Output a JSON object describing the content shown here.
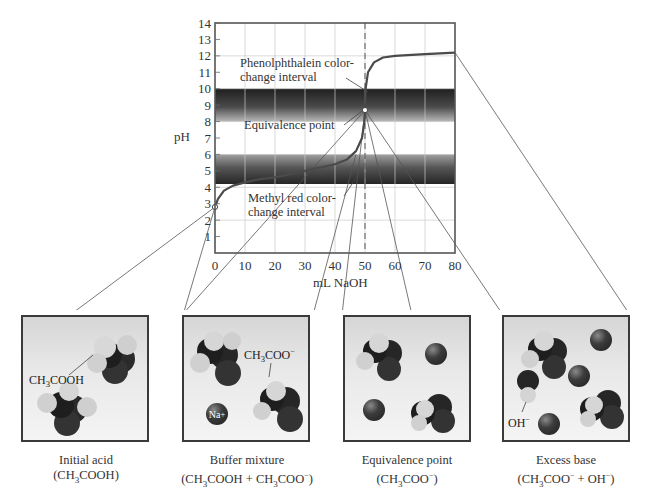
{
  "chart_data": {
    "type": "line",
    "xlabel": "mL NaOH",
    "ylabel": "pH",
    "xlim": [
      0,
      80
    ],
    "ylim": [
      0,
      14
    ],
    "x_ticks": [
      0,
      10,
      20,
      30,
      40,
      50,
      60,
      70,
      80
    ],
    "y_ticks": [
      1,
      2,
      3,
      4,
      5,
      6,
      7,
      8,
      9,
      10,
      11,
      12,
      13,
      14
    ],
    "grid": true,
    "series": [
      {
        "name": "pH",
        "x": [
          0,
          1,
          3,
          6,
          10,
          15,
          20,
          25,
          30,
          35,
          40,
          44,
          47,
          49,
          49.8,
          50,
          50.2,
          51,
          53,
          56,
          60,
          70,
          80
        ],
        "y": [
          2.8,
          3.3,
          3.8,
          4.1,
          4.3,
          4.5,
          4.6,
          4.8,
          5.0,
          5.2,
          5.4,
          5.7,
          6.2,
          7.0,
          8.0,
          8.7,
          10.0,
          11.0,
          11.6,
          11.9,
          12.0,
          12.1,
          12.2
        ]
      }
    ],
    "equivalence_point": {
      "x": 50,
      "y": 8.7,
      "label": "Equivalence point"
    },
    "initial_point": {
      "x": 0,
      "y": 2.8
    },
    "bands": [
      {
        "name": "Phenolphthalein color-change interval",
        "from": 8.0,
        "to": 10.0
      },
      {
        "name": "Methyl red color-change interval",
        "from": 4.2,
        "to": 6.0
      }
    ],
    "vertical_dashed_line": 50,
    "annotations": [
      "Phenolphthalein color-change interval",
      "Equivalence point",
      "Methyl red color-change interval"
    ]
  },
  "axis": {
    "y_label": "pH",
    "x_label": "mL NaOH",
    "y_ticks": [
      "1",
      "2",
      "3",
      "4",
      "5",
      "6",
      "7",
      "8",
      "9",
      "10",
      "11",
      "12",
      "13",
      "14"
    ],
    "x_ticks": [
      "0",
      "10",
      "20",
      "30",
      "40",
      "50",
      "60",
      "70",
      "80"
    ]
  },
  "annotations": {
    "phenol_line1": "Phenolphthalein color-",
    "phenol_line2": "change interval",
    "equivalence": "Equivalence point",
    "methyl_line1": "Methyl red color-",
    "methyl_line2": "change interval"
  },
  "beakers": [
    {
      "title": "Initial acid",
      "formula": "(CH3COOH)",
      "molecule_label": "CH3COOH"
    },
    {
      "title": "Buffer mixture",
      "formula": "(CH3COOH + CH3COO−)",
      "molecule_label": "CH3COO−",
      "ion_label": "Na+"
    },
    {
      "title": "Equivalence point",
      "formula": "(CH3COO−)"
    },
    {
      "title": "Excess base",
      "formula": "(CH3COO− + OH−)",
      "molecule_label": "OH−"
    }
  ],
  "colors": {
    "band_dark": "#2b2b2b",
    "band_light": "#bdbdbd",
    "curve": "#4a4a4a",
    "grid": "#c8c8c8",
    "frame": "#555555"
  }
}
